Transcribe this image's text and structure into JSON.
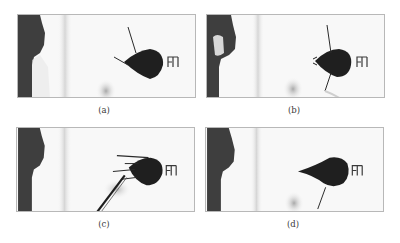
{
  "figure": {
    "panels": [
      {
        "id": "a",
        "label": "(a)",
        "probe": "two antennae: one upward-left, one leftward"
      },
      {
        "id": "b",
        "label": "(b)",
        "probe": "antennae up and down, mouthparts left"
      },
      {
        "id": "c",
        "label": "(c)",
        "probe": "forceps / tweezers inserted from lower left"
      },
      {
        "id": "d",
        "label": "(d)",
        "probe": "elongated snout left, antenna downward"
      }
    ]
  },
  "colors": {
    "panel_border": "#b8b8b8",
    "background": "#f7f7f7",
    "dark_region": "#3c3c3c",
    "insect_body": "#1e1e1e",
    "caption_text": "#3a3a3a"
  }
}
